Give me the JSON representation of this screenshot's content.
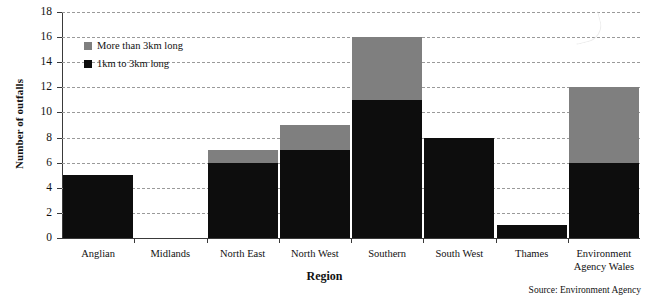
{
  "chart_data": {
    "type": "bar",
    "subtype": "stacked-vertical-bar",
    "title": "",
    "xlabel": "Region",
    "ylabel": "Number of outfalls",
    "ylim": [
      0,
      18
    ],
    "ytick_step": 2,
    "yticks": [
      0,
      2,
      4,
      6,
      8,
      10,
      12,
      14,
      16,
      18
    ],
    "ytick_labels": [
      "0",
      "2",
      "4",
      "6",
      "8",
      "10",
      "12",
      "14",
      "16",
      "18"
    ],
    "grid": true,
    "grid_axis": "y",
    "grid_style": "dashed",
    "legend_position": "upper-left-inside",
    "categories": [
      "Anglian",
      "Midlands",
      "North East",
      "North West",
      "Southern",
      "South West",
      "Thames",
      "Environment Agency Wales"
    ],
    "category_label_lines": [
      [
        "Anglian"
      ],
      [
        "Midlands"
      ],
      [
        "North East"
      ],
      [
        "North West"
      ],
      [
        "Southern"
      ],
      [
        "South West"
      ],
      [
        "Thames"
      ],
      [
        "Environment",
        "Agency Wales"
      ]
    ],
    "series": [
      {
        "name": "1km to 3km long",
        "color": "#0d0d0d",
        "values": [
          5,
          0,
          6,
          7,
          11,
          8,
          1,
          6
        ]
      },
      {
        "name": "More than 3km long",
        "color": "#7f7f7f",
        "values": [
          0,
          0,
          1,
          2,
          5,
          0,
          0,
          6
        ]
      }
    ],
    "stack_order_bottom_to_top": [
      "1km to 3km long",
      "More than 3km long"
    ],
    "totals": [
      5,
      0,
      7,
      9,
      16,
      8,
      1,
      12
    ],
    "annotations": [
      "Source: Environment Agency"
    ]
  },
  "legend": {
    "entries": [
      {
        "label": "More than 3km long",
        "color": "#7f7f7f"
      },
      {
        "label": "1km to 3km long",
        "color": "#0d0d0d"
      }
    ]
  },
  "axes": {
    "y_title": "Number of outfalls",
    "x_title": "Region"
  },
  "footer": {
    "source": "Source: Environment Agency"
  },
  "colors": {
    "more_than_3km": "#7f7f7f",
    "one_to_three_km": "#0d0d0d",
    "axis": "#3a3a3a",
    "gridline": "#9a9a9a",
    "background": "#ffffff"
  }
}
